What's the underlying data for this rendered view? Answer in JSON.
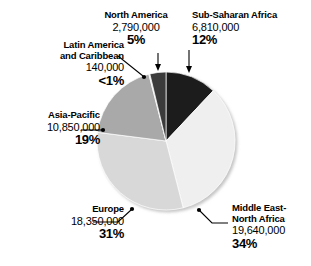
{
  "chart_data": {
    "type": "pie",
    "title": "",
    "subtitle": "",
    "xlabel": "",
    "ylabel": "",
    "legend_position": "none",
    "grid": false,
    "total": 58580000,
    "categories": [
      "Sub-Saharan Africa",
      "Middle East-North Africa",
      "Europe",
      "Asia-Pacific",
      "Latin America and Caribbean",
      "North America"
    ],
    "values": [
      6810000,
      19640000,
      18350000,
      10850000,
      140000,
      2790000
    ],
    "percents": [
      12,
      34,
      31,
      19,
      0.24,
      5
    ],
    "slices": [
      {
        "name": "Sub-Saharan Africa",
        "name_line1": "Sub-Saharan Africa",
        "name_line2": "",
        "value": "6,810,000",
        "percent": "12%",
        "percent_num": 12,
        "color": "#1c1c1c",
        "start_angle": 0,
        "end_angle": 43.2
      },
      {
        "name": "Middle East-North Africa",
        "name_line1": "Middle East-",
        "name_line2": "North Africa",
        "value": "19,640,000",
        "percent": "34%",
        "percent_num": 34,
        "color": "#efefef",
        "start_angle": 43.2,
        "end_angle": 165.6
      },
      {
        "name": "Europe",
        "name_line1": "Europe",
        "name_line2": "",
        "value": "18,350,000",
        "percent": "31%",
        "percent_num": 31,
        "color": "#d8d8d8",
        "start_angle": 165.6,
        "end_angle": 277.2
      },
      {
        "name": "Asia-Pacific",
        "name_line1": "Asia-Pacific",
        "name_line2": "",
        "value": "10,850,000",
        "percent": "19%",
        "percent_num": 19,
        "color": "#a9a9a9",
        "start_angle": 277.2,
        "end_angle": 345.6
      },
      {
        "name": "Latin America and Caribbean",
        "name_line1": "Latin America",
        "name_line2": "and Caribbean",
        "value": "140,000",
        "percent": "<1%",
        "percent_num": 0.24,
        "color": "#e2e2e2",
        "start_angle": 345.6,
        "end_angle": 346.5
      },
      {
        "name": "North America",
        "name_line1": "North America",
        "name_line2": "",
        "value": "2,790,000",
        "percent": "5%",
        "percent_num": 5,
        "color": "#3b3b3b",
        "start_angle": 346.5,
        "end_angle": 360
      }
    ]
  },
  "labels": {
    "north_america": {
      "name": "North America",
      "value": "2,790,000",
      "percent": "5%"
    },
    "sub_saharan_africa": {
      "name": "Sub-Saharan Africa",
      "value": "6,810,000",
      "percent": "12%"
    },
    "latin_america": {
      "name_line1": "Latin America",
      "name_line2": "and Caribbean",
      "value": "140,000",
      "percent": "<1%"
    },
    "asia_pacific": {
      "name": "Asia-Pacific",
      "value": "10,850,000",
      "percent": "19%"
    },
    "europe": {
      "name": "Europe",
      "value": "18,350,000",
      "percent": "31%"
    },
    "middle_east": {
      "name_line1": "Middle East-",
      "name_line2": "North Africa",
      "value": "19,640,000",
      "percent": "34%"
    }
  },
  "colors": {
    "background": "#ffffff",
    "text": "#000000",
    "leader_line": "#000000",
    "sub_saharan_africa": "#1c1c1c",
    "middle_east_north_africa": "#efefef",
    "europe": "#d8d8d8",
    "asia_pacific": "#a9a9a9",
    "latin_america_caribbean": "#e2e2e2",
    "north_america": "#3b3b3b"
  }
}
